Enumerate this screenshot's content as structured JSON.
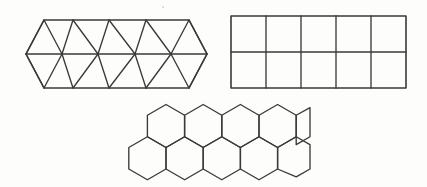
{
  "figure": {
    "background_color": "#fdfdfb",
    "stroke_color": "#3a3a3a",
    "stroke_width": 1.35,
    "width": 427,
    "height": 187
  },
  "panels": [
    {
      "id": "triangular-tiling",
      "name": "Triangular tiling band",
      "polygon": "triangle",
      "sides": 3,
      "label": "Triangles",
      "rows": 2,
      "columns": 5,
      "upward_triangles_per_row": 5,
      "downward_triangles_per_row": 4,
      "total_triangles": 18,
      "bounds": {
        "x": 26,
        "y": 20,
        "width": 181,
        "height": 68
      },
      "geometry": {
        "cell_width": 36.2,
        "row_height": 34,
        "left_apex_x": 26,
        "right_apex_x": 207,
        "top_y": 20,
        "mid_y": 54,
        "bottom_y": 88,
        "top_left_x": 44,
        "top_right_x": 189
      }
    },
    {
      "id": "square-tiling",
      "name": "Square grid",
      "polygon": "square",
      "sides": 4,
      "label": "Squares",
      "rows": 2,
      "columns": 5,
      "total_squares": 10,
      "bounds": {
        "x": 231,
        "y": 16,
        "width": 175,
        "height": 72
      },
      "geometry": {
        "cell_width": 35,
        "cell_height": 36,
        "left_x": 231,
        "right_x": 406,
        "top_y": 16,
        "bottom_y": 88
      }
    },
    {
      "id": "hexagonal-tiling",
      "name": "Hexagonal honeycomb",
      "polygon": "hexagon",
      "sides": 6,
      "label": "Hexagons",
      "rows": 2,
      "top_row_count": 5,
      "bottom_row_count": 5,
      "total_hexagons": 10,
      "bounds": {
        "x": 126,
        "y": 104,
        "width": 184,
        "height": 74
      },
      "geometry": {
        "circumradius": 21.5,
        "apothem": 18.6,
        "horizontal_step": 37.2,
        "vertical_step": 32.2,
        "top_row_center_y": 126,
        "bottom_row_center_y": 158,
        "top_row_first_center_x": 166,
        "bottom_row_first_center_x": 147.4
      }
    }
  ],
  "artifacts": [
    {
      "id": "speck",
      "name": "paper-speck",
      "x": 163,
      "y": 7,
      "r": 1.1
    }
  ]
}
